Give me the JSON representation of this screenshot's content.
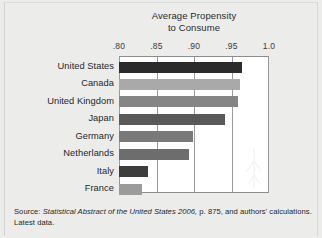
{
  "figure": {
    "title_line1": "Average Propensity",
    "title_line2": "to Consume",
    "source_lead": "Source:",
    "source_italic": " Statistical Abstract of the United States 2006,",
    "source_tail": " p. 875, and authors' calculations.",
    "source_line2": "Latest data."
  },
  "chart_data": {
    "type": "bar",
    "orientation": "horizontal",
    "title": "Average Propensity to Consume",
    "xlabel": "",
    "ylabel": "",
    "xlim": [
      0.8,
      1.0
    ],
    "grid": true,
    "legend": "none",
    "tick_labels": [
      ".80",
      ".85",
      ".90",
      ".95",
      "1.0"
    ],
    "tick_values": [
      0.8,
      0.85,
      0.9,
      0.95,
      1.0
    ],
    "categories": [
      "United States",
      "Canada",
      "United Kingdom",
      "Japan",
      "Germany",
      "Netherlands",
      "Italy",
      "France"
    ],
    "values": [
      0.964,
      0.961,
      0.958,
      0.941,
      0.898,
      0.893,
      0.839,
      0.831
    ],
    "bar_colors": [
      "#2b2b2b",
      "#a9a9a9",
      "#858585",
      "#595959",
      "#797979",
      "#6d6d6d",
      "#3d3d3d",
      "#9b9b9b"
    ]
  }
}
